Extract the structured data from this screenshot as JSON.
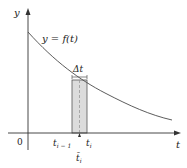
{
  "diagram": {
    "y_axis_label": "y",
    "x_axis_label": "t",
    "origin_label": "0",
    "curve_label": "y = f(t)",
    "delta_label": "Δt",
    "left_edge_label": "t",
    "left_edge_sub": "i − 1",
    "right_edge_label": "t",
    "right_edge_sub": "i",
    "sample_point_label": "t̄",
    "sample_point_sub": "i",
    "colors": {
      "axis": "#333333",
      "curve": "#4a4a4a",
      "rect_fill": "#dcdcdc",
      "rect_stroke": "#555555",
      "dashed_line": "#999999"
    }
  }
}
